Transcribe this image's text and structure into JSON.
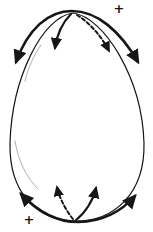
{
  "figure": {
    "name": "egg-rotation-diagram",
    "plus_top_right": "+",
    "plus_bottom_left": "+"
  },
  "colors": {
    "ink": "#161616",
    "highlight": "#9a9a9a",
    "background": "#ffffff"
  },
  "icons": [
    {
      "name": "top-sweep-arrow",
      "style": "thick solid arc, arrowheads both ends pointing down-outward"
    },
    {
      "name": "top-solid-arrow",
      "style": "solid curve from apex, arrowhead pointing down"
    },
    {
      "name": "top-dashed-arrow",
      "style": "dashed curve from apex, arrowhead pointing down-right"
    },
    {
      "name": "bottom-sweep-arrow",
      "style": "thick solid arc, arrowheads both ends pointing up-outward"
    },
    {
      "name": "bottom-solid-arrow",
      "style": "solid curve from bottom, arrowhead pointing up"
    },
    {
      "name": "bottom-dashed-arrow",
      "style": "dashed curve from bottom, arrowhead pointing up-left"
    }
  ]
}
